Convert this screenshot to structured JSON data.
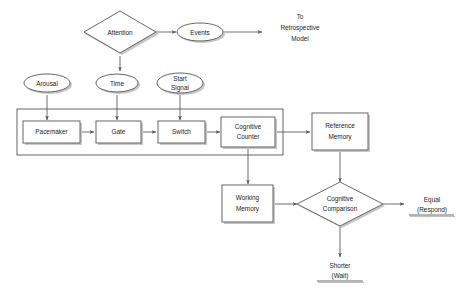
{
  "diagram": {
    "background_color": "#ffffff",
    "stroke_color": "#555555",
    "text_color": "#222222",
    "shadow_color": "#c8c8c8"
  },
  "nodes": {
    "attention": {
      "label": "Attention",
      "shape": "diamond"
    },
    "events": {
      "label": "Events",
      "shape": "ellipse"
    },
    "arousal": {
      "label": "Arousal",
      "shape": "ellipse"
    },
    "time": {
      "label": "Time",
      "shape": "ellipse"
    },
    "start_signal": {
      "label_line1": "Start",
      "label_line2": "Signal",
      "shape": "ellipse"
    },
    "pacemaker": {
      "label": "Pacemaker",
      "shape": "rect"
    },
    "gate": {
      "label": "Gate",
      "shape": "rect"
    },
    "switch": {
      "label": "Switch",
      "shape": "rect"
    },
    "cognitive_counter": {
      "label_line1": "Cognitive",
      "label_line2": "Counter",
      "shape": "rect"
    },
    "reference_memory": {
      "label_line1": "Reference",
      "label_line2": "Memory",
      "shape": "rect"
    },
    "working_memory": {
      "label_line1": "Working",
      "label_line2": "Memory",
      "shape": "rect"
    },
    "cognitive_comparison": {
      "label_line1": "Cognitive",
      "label_line2": "Comparison",
      "shape": "diamond"
    }
  },
  "annotations": {
    "retrospective": {
      "line1": "To",
      "line2": "Retrospective",
      "line3": "Model"
    },
    "equal_outcome": {
      "line1": "Equal",
      "line2": "(Respond)"
    },
    "shorter_outcome": {
      "line1": "Shorter",
      "line2": "(Wait)"
    }
  }
}
